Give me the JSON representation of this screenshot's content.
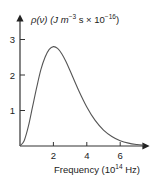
{
  "chart_data": {
    "type": "line",
    "title": "",
    "ylabel": "ρ(ν) (J m⁻³ s × 10⁻¹⁶)",
    "ylabel_parts": {
      "main": "ρ(ν) (J m",
      "exp1": "−3",
      "mid": " s  × 10",
      "exp2": "−16",
      "end": ")"
    },
    "xlabel": "Frequency (10¹⁴ Hz)",
    "xlabel_parts": {
      "main": "Frequency  (10",
      "exp": "14",
      "end": " Hz)"
    },
    "xticks": [
      "2",
      "4",
      "6"
    ],
    "yticks": [
      "1",
      "2",
      "3"
    ],
    "xlim": [
      0,
      7.6
    ],
    "ylim": [
      0,
      3.6
    ],
    "grid": false,
    "series": [
      {
        "name": "spectral energy density",
        "x": [
          0,
          0.25,
          0.5,
          0.75,
          1.0,
          1.25,
          1.5,
          1.75,
          2.0,
          2.25,
          2.5,
          2.75,
          3.0,
          3.5,
          4.0,
          4.5,
          5.0,
          5.5,
          6.0,
          6.5,
          7.0,
          7.4
        ],
        "y": [
          0,
          0.15,
          0.55,
          1.1,
          1.65,
          2.15,
          2.5,
          2.72,
          2.8,
          2.75,
          2.6,
          2.38,
          2.12,
          1.58,
          1.1,
          0.72,
          0.45,
          0.27,
          0.15,
          0.08,
          0.04,
          0.02
        ]
      }
    ]
  }
}
